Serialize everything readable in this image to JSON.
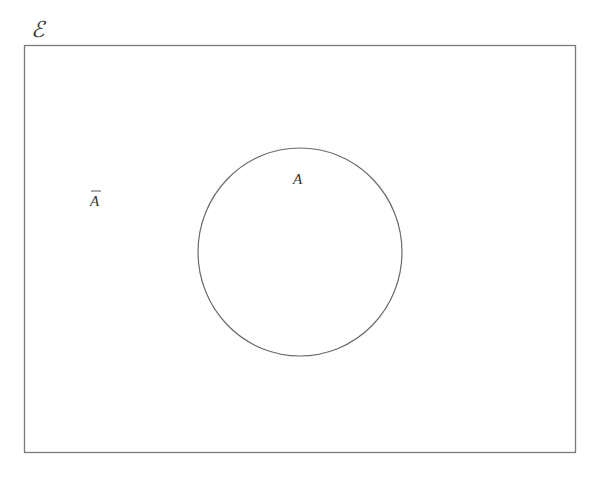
{
  "diagram": {
    "type": "venn",
    "universal_set": {
      "label": "ℰ",
      "rect": {
        "x": 24,
        "y": 45,
        "width": 552,
        "height": 408
      },
      "stroke": "#777777"
    },
    "sets": [
      {
        "name": "A",
        "label": "A",
        "cx": 300,
        "cy": 252,
        "rx": 102,
        "ry": 104,
        "stroke": "#666666",
        "label_pos": {
          "x": 299,
          "y": 183
        }
      }
    ],
    "complement": {
      "label": "A",
      "overbar": true,
      "label_pos": {
        "x": 96,
        "y": 205
      }
    }
  }
}
